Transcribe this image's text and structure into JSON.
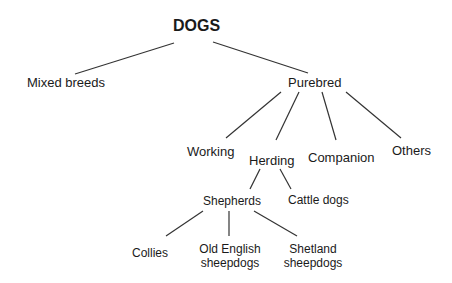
{
  "diagram": {
    "type": "tree",
    "root": "DOGS",
    "nodes": {
      "dogs": "DOGS",
      "mixed": "Mixed breeds",
      "purebred": "Purebred",
      "working": "Working",
      "herding": "Herding",
      "companion": "Companion",
      "others": "Others",
      "shepherds": "Shepherds",
      "cattle": "Cattle dogs",
      "collies": "Collies",
      "oldenglish_1": "Old English",
      "oldenglish_2": "sheepdogs",
      "shetland_1": "Shetland",
      "shetland_2": "sheepdogs"
    },
    "edges": [
      [
        "DOGS",
        "Mixed breeds"
      ],
      [
        "DOGS",
        "Purebred"
      ],
      [
        "Purebred",
        "Working"
      ],
      [
        "Purebred",
        "Herding"
      ],
      [
        "Purebred",
        "Companion"
      ],
      [
        "Purebred",
        "Others"
      ],
      [
        "Herding",
        "Shepherds"
      ],
      [
        "Herding",
        "Cattle dogs"
      ],
      [
        "Shepherds",
        "Collies"
      ],
      [
        "Shepherds",
        "Old English sheepdogs"
      ],
      [
        "Shepherds",
        "Shetland sheepdogs"
      ]
    ],
    "line_color": "#333333"
  }
}
